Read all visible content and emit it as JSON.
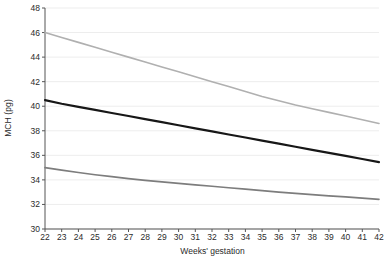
{
  "chart_data": {
    "type": "line",
    "title": "",
    "xlabel": "Weeks' gestation",
    "ylabel": "MCH (pg)",
    "xlim": [
      22,
      42
    ],
    "ylim": [
      30,
      48
    ],
    "ytick_step": 2,
    "xtick_step": 1,
    "grid": true,
    "legend": "none",
    "xticks": [
      22,
      23,
      24,
      25,
      26,
      27,
      28,
      29,
      30,
      31,
      32,
      33,
      34,
      35,
      36,
      37,
      38,
      39,
      40,
      41,
      42
    ],
    "yticks": [
      30,
      32,
      34,
      36,
      38,
      40,
      42,
      44,
      46,
      48
    ],
    "x": [
      22,
      23,
      24,
      25,
      26,
      27,
      28,
      29,
      30,
      31,
      32,
      33,
      34,
      35,
      36,
      37,
      38,
      39,
      40,
      41,
      42
    ],
    "series": [
      {
        "name": "upper-centile",
        "color": "#b0b0b0",
        "width": 1.6,
        "values": [
          46.0,
          45.6,
          45.2,
          44.8,
          44.4,
          44.0,
          43.6,
          43.2,
          42.8,
          42.4,
          42.0,
          41.6,
          41.2,
          40.8,
          40.45,
          40.1,
          39.8,
          39.5,
          39.2,
          38.9,
          38.6
        ]
      },
      {
        "name": "median",
        "color": "#171717",
        "width": 2.2,
        "values": [
          40.5,
          40.2,
          39.95,
          39.7,
          39.45,
          39.2,
          38.95,
          38.7,
          38.45,
          38.2,
          37.95,
          37.7,
          37.45,
          37.2,
          36.95,
          36.7,
          36.45,
          36.2,
          35.95,
          35.7,
          35.45
        ]
      },
      {
        "name": "lower-centile",
        "color": "#7d7d7d",
        "width": 1.7,
        "values": [
          35.0,
          34.8,
          34.6,
          34.42,
          34.26,
          34.1,
          33.96,
          33.84,
          33.72,
          33.6,
          33.48,
          33.36,
          33.24,
          33.12,
          33.0,
          32.9,
          32.8,
          32.7,
          32.62,
          32.52,
          32.42
        ]
      }
    ],
    "axis_color": "#555555",
    "grid_color": "#ededed",
    "text_color": "#2b2b2b"
  },
  "labels": {
    "y_axis_title": "MCH (pg)",
    "x_axis_title": "Weeks' gestation"
  }
}
